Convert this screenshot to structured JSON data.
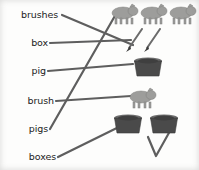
{
  "worksheet": {
    "title": "singular and plural matching exercise",
    "background_color": "#fdfdfc",
    "line_color": "#5e5e5e",
    "text_color": "#1b1b1b"
  },
  "words": [
    {
      "label": "brushes",
      "x": 58,
      "y": 18,
      "anchor_x": 60,
      "anchor_y": 14
    },
    {
      "label": "box",
      "x": 46,
      "y": 46,
      "anchor_x": 48,
      "anchor_y": 42
    },
    {
      "label": "pig",
      "x": 44,
      "y": 74,
      "anchor_x": 46,
      "anchor_y": 70
    },
    {
      "label": "brush",
      "x": 52,
      "y": 104,
      "anchor_x": 54,
      "anchor_y": 100
    },
    {
      "label": "pigs",
      "x": 46,
      "y": 132,
      "anchor_x": 48,
      "anchor_y": 128
    },
    {
      "label": "boxes",
      "x": 54,
      "y": 160,
      "anchor_x": 56,
      "anchor_y": 156
    }
  ],
  "pictures": [
    {
      "name": "three-pigs",
      "kind": "pig",
      "count": 3,
      "x": 112,
      "y": 4,
      "color": "#9a9a98"
    },
    {
      "name": "two-brushes",
      "kind": "brush",
      "count": 2,
      "x": 122,
      "y": 28,
      "color": "#6b6b6b"
    },
    {
      "name": "one-box",
      "kind": "box",
      "count": 1,
      "x": 132,
      "y": 57,
      "color": "#4a4a4a"
    },
    {
      "name": "one-pig",
      "kind": "pig",
      "count": 1,
      "x": 128,
      "y": 88,
      "color": "#9a9a98"
    },
    {
      "name": "two-boxes",
      "kind": "box",
      "count": 2,
      "x": 112,
      "y": 114,
      "color": "#4a4a4a"
    }
  ],
  "connections": [
    {
      "from": "brushes",
      "to": "two-brushes",
      "x1": 62,
      "y1": 15,
      "x2": 133,
      "y2": 45
    },
    {
      "from": "box",
      "to": "one-box",
      "x1": 50,
      "y1": 43,
      "x2": 131,
      "y2": 40
    },
    {
      "from": "pig",
      "to": "one-pig",
      "x1": 48,
      "y1": 71,
      "x2": 133,
      "y2": 64
    },
    {
      "from": "brush",
      "to": "stray-mark",
      "x1": 56,
      "y1": 101,
      "x2": 131,
      "y2": 96
    },
    {
      "from": "pigs",
      "to": "three-pigs",
      "x1": 50,
      "y1": 129,
      "x2": 116,
      "y2": 14
    },
    {
      "from": "boxes",
      "to": "two-boxes",
      "x1": 58,
      "y1": 157,
      "x2": 129,
      "y2": 122
    }
  ],
  "stray_mark": {
    "name": "check-mark-stroke",
    "points": "148,137 156,156 170,131"
  }
}
